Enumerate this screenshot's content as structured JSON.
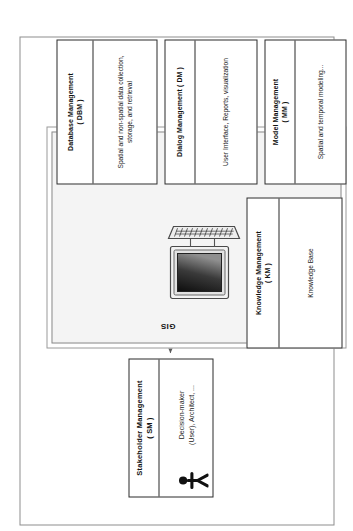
{
  "figure": {
    "orientation": "rotated-90-ccw",
    "colors": {
      "gis_fill": "#f4f4f4",
      "gis_dots": "#b9b9b9",
      "box_border": "#2b2b2b",
      "frame_border": "#8d8d8d",
      "arrow": "#555555",
      "text": "#111111"
    }
  },
  "stakeholder": {
    "title": "Stakeholder  Management\n( SM )",
    "title_line1": "Stakeholder  Management",
    "title_line2": "( SM )",
    "caption": "Decision-maker\n(User), Architect, ...",
    "caption_line1": "Decision-maker",
    "caption_line2": "(User), Architect, ...",
    "icon": "person-icon"
  },
  "gis": {
    "label": "GIS",
    "computer_icon": "desktop-computer-icon"
  },
  "modules": [
    {
      "id": "km",
      "title_line1": "Knowledge Management",
      "title_line2": "( KM )",
      "body": "Knowledge Base"
    },
    {
      "id": "dbm",
      "title_line1": "Database Management",
      "title_line2": "( DBM )",
      "body": "Spatial and  non-spatial data collection, storage, and retrieval"
    },
    {
      "id": "dm",
      "title_line1": "Dialog Management ( DM )",
      "title_line2": "",
      "body": "User Interface, Reports, visualization"
    },
    {
      "id": "mm",
      "title_line1": "Model Management",
      "title_line2": "( MM )",
      "body": "Spatial and temporal modeling..."
    }
  ],
  "connections": [
    {
      "name": "stakeholder-computer",
      "from": "computer",
      "to": "stakeholder",
      "style": "double-arrow"
    },
    {
      "name": "computer-knowledge",
      "from": "computer",
      "to": "km",
      "style": "double-arrow"
    },
    {
      "name": "computer-database",
      "from": "computer",
      "to": "dbm",
      "style": "arrow"
    },
    {
      "name": "computer-dialog",
      "from": "computer",
      "to": "dm",
      "style": "arrow"
    },
    {
      "name": "computer-model",
      "from": "computer",
      "to": "mm",
      "style": "arrow"
    }
  ]
}
